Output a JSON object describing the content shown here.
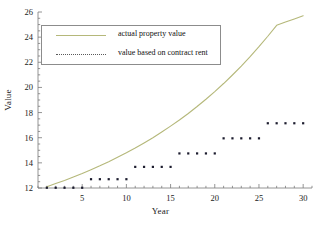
{
  "chart_data": {
    "type": "line",
    "title": "",
    "xlabel": "Year",
    "ylabel": "Value",
    "xlim": [
      0,
      31
    ],
    "ylim": [
      12,
      26
    ],
    "grid": false,
    "legend_position": "upper-left",
    "xticks": [
      5,
      10,
      15,
      20,
      25,
      30
    ],
    "xtick_labels": [
      "5",
      "10",
      "15",
      "20",
      "25",
      "30"
    ],
    "yticks": [
      12,
      14,
      16,
      18,
      20,
      22,
      24,
      26
    ],
    "ytick_labels": [
      "12",
      "14",
      "16",
      "18",
      "20",
      "22",
      "24",
      "26"
    ],
    "x_minor_tick_step": 1,
    "y_minor_tick_step": 0.5,
    "series": [
      {
        "name": "actual property value",
        "style": "solid-line",
        "color": "#b5b87a",
        "x": [
          1,
          2,
          3,
          4,
          5,
          6,
          7,
          8,
          9,
          10,
          11,
          12,
          13,
          14,
          15,
          16,
          17,
          18,
          19,
          20,
          21,
          22,
          23,
          24,
          25,
          26,
          27,
          28,
          29,
          30
        ],
        "values": [
          12.1,
          12.35,
          12.6,
          12.87,
          13.15,
          13.45,
          13.76,
          14.09,
          14.44,
          14.8,
          15.18,
          15.58,
          16.0,
          16.45,
          16.92,
          17.41,
          17.93,
          18.48,
          19.06,
          19.67,
          20.31,
          20.99,
          21.7,
          22.45,
          23.24,
          24.07,
          24.94,
          25.2,
          25.45,
          25.7
        ]
      },
      {
        "name": "value based on contract rent",
        "style": "dotted-points",
        "color": "#1c1c2e",
        "x": [
          1,
          2,
          3,
          4,
          5,
          6,
          7,
          8,
          9,
          10,
          11,
          12,
          13,
          14,
          15,
          16,
          17,
          18,
          19,
          20,
          21,
          22,
          23,
          24,
          25,
          26,
          27,
          28,
          29,
          30
        ],
        "values": [
          12.02,
          12.02,
          12.02,
          12.02,
          12.02,
          12.7,
          12.7,
          12.7,
          12.7,
          12.7,
          13.68,
          13.68,
          13.68,
          13.68,
          13.68,
          14.75,
          14.75,
          14.75,
          14.75,
          14.75,
          15.95,
          15.95,
          15.95,
          15.95,
          15.95,
          17.15,
          17.15,
          17.15,
          17.15,
          17.15
        ]
      }
    ]
  },
  "legend": {
    "entries": [
      {
        "label": "actual property value",
        "style": "solid"
      },
      {
        "label": "value based on contract rent",
        "style": "dotted"
      }
    ]
  },
  "colors": {
    "curve": "#b5b87a",
    "points": "#1c1c2e",
    "axis": "#7a7a7a",
    "legend_border": "#8c8c8c",
    "text": "#1a1a1a",
    "background": "#ffffff"
  }
}
